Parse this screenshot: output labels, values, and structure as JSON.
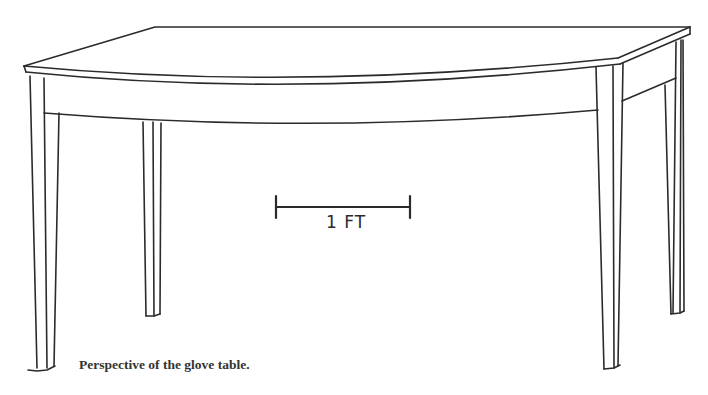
{
  "figure": {
    "scale_bar": {
      "label": "1 FT",
      "represents_feet": 1
    },
    "caption": "Perspective of the glove table."
  },
  "colors": {
    "ink": "#2b2b2b",
    "caption": "#333333",
    "background": "#ffffff"
  }
}
